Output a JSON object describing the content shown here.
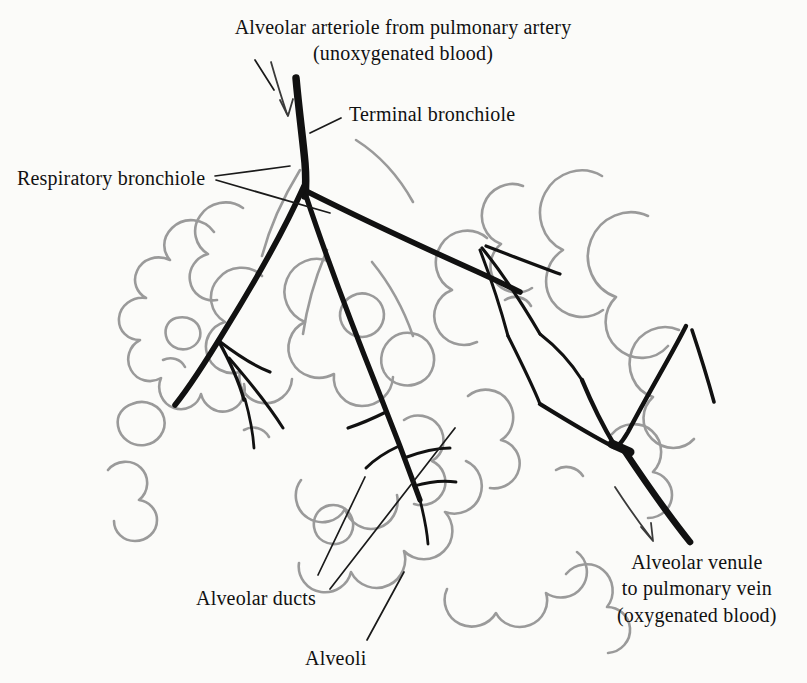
{
  "figure": {
    "width": 807,
    "height": 683,
    "background_color": "#fbfbf9",
    "ink_color": "#111111",
    "alveoli_outline_color": "#9a9a9a"
  },
  "labels": {
    "arteriole": {
      "line1": "Alveolar arteriole from pulmonary artery",
      "line2": "(unoxygenated blood)"
    },
    "terminal_bronchiole": "Terminal bronchiole",
    "respiratory_bronchiole": "Respiratory  bronchiole",
    "alveolar_ducts": "Alveolar ducts",
    "alveoli": "Alveoli",
    "venule": {
      "line1": "Alveolar venule",
      "line2": "to pulmonary vein",
      "line3": "(oxygenated blood)"
    }
  }
}
